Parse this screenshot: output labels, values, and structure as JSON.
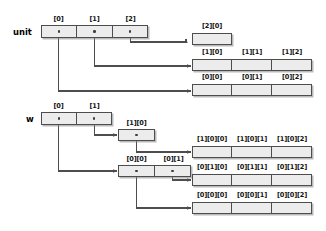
{
  "diagram": {
    "colors": {
      "cell_fill": "#ececec",
      "border": "#4d4d4d",
      "wire": "#4d4d4d",
      "text": "#111111",
      "background": "#ffffff"
    }
  },
  "unit_section": {
    "var_label": "unit",
    "top_labels": [
      "[0]",
      "[1]",
      "[2]"
    ],
    "rows": [
      {
        "name": "unit-row-2",
        "labels": [
          "[2][0]"
        ]
      },
      {
        "name": "unit-row-1",
        "labels": [
          "[1][0]",
          "[1][1]",
          "[1][2]"
        ]
      },
      {
        "name": "unit-row-0",
        "labels": [
          "[0][0]",
          "[0][1]",
          "[0][2]"
        ]
      }
    ]
  },
  "w_section": {
    "var_label": "w",
    "top_labels": [
      "[0]",
      "[1]"
    ],
    "mid_rows": [
      {
        "name": "w-mid-row-1",
        "labels": [
          "[1][0]"
        ]
      },
      {
        "name": "w-mid-row-0",
        "labels": [
          "[0][0]",
          "[0][1]"
        ]
      }
    ],
    "leaf_rows": [
      {
        "name": "w-leaf-row-10",
        "labels": [
          "[1][0][0]",
          "[1][0][1]",
          "[1][0][2]"
        ]
      },
      {
        "name": "w-leaf-row-01",
        "labels": [
          "[0][1][0]",
          "[0][1][1]",
          "[0][1][2]"
        ]
      },
      {
        "name": "w-leaf-row-00",
        "labels": [
          "[0][0][0]",
          "[0][0][1]",
          "[0][0][2]"
        ]
      }
    ]
  }
}
